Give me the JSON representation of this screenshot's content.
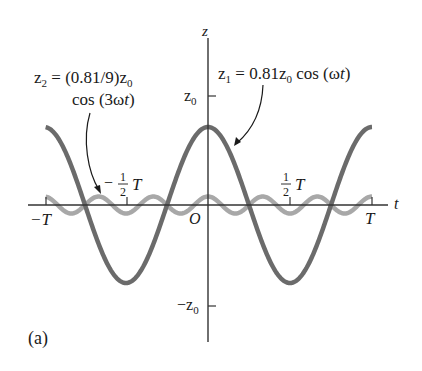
{
  "figure": {
    "panel_label": "(a)",
    "axes": {
      "vertical_label": "z",
      "horizontal_label": "t",
      "origin_label": "O",
      "z_ticks": {
        "positive": "z",
        "positive_sub": "0",
        "negative": "−z",
        "negative_sub": "0"
      },
      "t_ticks": {
        "neg_T": "−T",
        "pos_T": "T",
        "neg_half_sign": "−",
        "half_num": "1",
        "half_den": "2",
        "half_T": "T"
      }
    },
    "annotations": {
      "z1": {
        "lhs": "z",
        "lhs_sub": "1",
        "eq": " = 0.81z",
        "z_sub": "0",
        "rest": " cos (ω",
        "t": "t",
        "close": ")"
      },
      "z2": {
        "line1_lhs": "z",
        "line1_lhs_sub": "2",
        "line1_eq": " = (0.81/9)z",
        "line1_sub": "0",
        "line2": "cos (3ω",
        "line2_t": "t",
        "line2_close": ")"
      }
    },
    "colors": {
      "z1_curve": "#6b6b6b",
      "z2_curve": "#a8a8a8",
      "axes": "#333333",
      "text": "#1a1a1a"
    }
  }
}
